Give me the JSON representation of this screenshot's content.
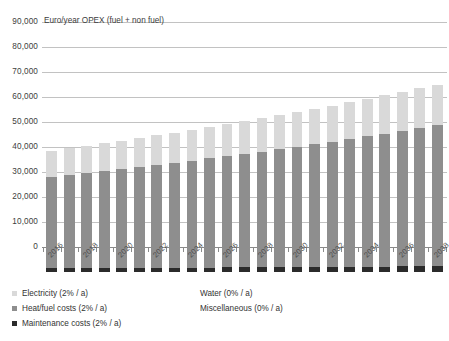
{
  "chart_data": {
    "type": "bar",
    "stacked": true,
    "title": "Euro/year OPEX (fuel + non fuel)",
    "xlabel": "",
    "ylabel": "",
    "ylim": [
      0,
      90000
    ],
    "ytick_step": 10000,
    "yticks": [
      "0",
      "10,000",
      "20,000",
      "30,000",
      "40,000",
      "50,000",
      "60,000",
      "70,000",
      "80,000",
      "90,000"
    ],
    "grid": true,
    "legend_position": "bottom",
    "categories": [
      "2016",
      "2017",
      "2018",
      "2019",
      "2020",
      "2021",
      "2022",
      "2023",
      "2024",
      "2025",
      "2026",
      "2027",
      "2028",
      "2029",
      "2030",
      "2031",
      "2032",
      "2033",
      "2034",
      "2035",
      "2036",
      "2037",
      "2038"
    ],
    "tick_labels": [
      "2016",
      "2018",
      "2020",
      "2022",
      "2024",
      "2026",
      "2028",
      "2030",
      "2032",
      "2034",
      "2036",
      "2038"
    ],
    "series": [
      {
        "name": "Maintenance costs (2% / a)",
        "color": "#2b2b2b",
        "values": [
          1500,
          1530,
          1561,
          1592,
          1624,
          1656,
          1689,
          1723,
          1758,
          1793,
          1829,
          1865,
          1903,
          1941,
          1980,
          2019,
          2060,
          2101,
          2143,
          2186,
          2230,
          2274,
          2320
        ]
      },
      {
        "name": "Heat/fuel costs (2% / a)",
        "color": "#8e8e8e",
        "values": [
          36500,
          37230,
          37975,
          38734,
          39509,
          40299,
          41105,
          41927,
          42766,
          43621,
          44493,
          45383,
          46291,
          47217,
          48161,
          49124,
          50107,
          51109,
          52131,
          53174,
          54237,
          55322,
          56430
        ]
      },
      {
        "name": "Electricity (2% / a)",
        "color": "#d9d9d9",
        "values": [
          10500,
          10710,
          10924,
          11143,
          11366,
          11593,
          11825,
          12061,
          12303,
          12549,
          12800,
          13056,
          13317,
          13583,
          13855,
          14132,
          14414,
          14703,
          14997,
          15297,
          15603,
          15915,
          16233
        ]
      },
      {
        "name": "Water (0% / a)",
        "color": "#ffffff",
        "values": [
          0,
          0,
          0,
          0,
          0,
          0,
          0,
          0,
          0,
          0,
          0,
          0,
          0,
          0,
          0,
          0,
          0,
          0,
          0,
          0,
          0,
          0,
          0
        ]
      },
      {
        "name": "Miscellaneous (0% / a)",
        "color": "#ffffff",
        "values": [
          0,
          0,
          0,
          0,
          0,
          0,
          0,
          0,
          0,
          0,
          0,
          0,
          0,
          0,
          0,
          0,
          0,
          0,
          0,
          0,
          0,
          0,
          0
        ]
      }
    ],
    "totals": [
      48500,
      49470,
      50460,
      51469,
      52499,
      53548,
      54619,
      55711,
      56827,
      57963,
      59122,
      60304,
      61511,
      62741,
      63996,
      65275,
      66581,
      67913,
      69271,
      70657,
      72070,
      73511,
      74983
    ]
  },
  "legend": {
    "left_column": [
      {
        "label": "Electricity (2% / a)",
        "color": "#d9d9d9"
      },
      {
        "label": "Heat/fuel costs (2% / a)",
        "color": "#8e8e8e"
      },
      {
        "label": "Maintenance costs (2% / a)",
        "color": "#2b2b2b"
      }
    ],
    "right_column": [
      {
        "label": "Water (0% / a)",
        "color": "#ffffff"
      },
      {
        "label": "Miscellaneous (0% / a)",
        "color": "#ffffff"
      }
    ]
  }
}
